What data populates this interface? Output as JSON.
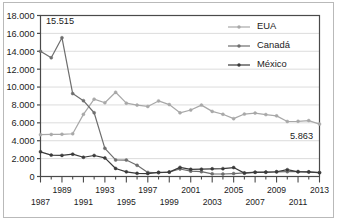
{
  "chart_data": {
    "type": "line",
    "title": "",
    "subtitle": "",
    "xlabel": "",
    "ylabel": "",
    "xlim": [
      1987,
      2013
    ],
    "ylim": [
      0,
      18000
    ],
    "grid": true,
    "grid_axis": "y",
    "legend_position": "top-right",
    "x": [
      1987,
      1988,
      1989,
      1990,
      1991,
      1992,
      1993,
      1994,
      1995,
      1996,
      1997,
      1998,
      1999,
      2000,
      2001,
      2002,
      2003,
      2004,
      2005,
      2006,
      2007,
      2008,
      2009,
      2010,
      2011,
      2012,
      2013
    ],
    "y_tick_labels": [
      "0",
      "2.000",
      "4.000",
      "6.000",
      "8.000",
      "10.000",
      "12.000",
      "14.000",
      "16.000",
      "18.000"
    ],
    "y_tick_values": [
      0,
      2000,
      4000,
      6000,
      8000,
      10000,
      12000,
      14000,
      16000,
      18000
    ],
    "x_tick_labels_upper": [
      "1989",
      "1993",
      "1997",
      "2001",
      "2005",
      "2009",
      "2013"
    ],
    "x_tick_values_upper": [
      1989,
      1993,
      1997,
      2001,
      2005,
      2009,
      2013
    ],
    "x_tick_labels_lower": [
      "1987",
      "1991",
      "1995",
      "1999",
      "2003",
      "2007",
      "2011"
    ],
    "x_tick_values_lower": [
      1987,
      1991,
      1995,
      1999,
      2003,
      2007,
      2011
    ],
    "series": [
      {
        "name": "EUA",
        "color": "#a8a8a8",
        "values": [
          4680,
          4700,
          4720,
          4780,
          6950,
          8650,
          8250,
          9420,
          8200,
          7980,
          7830,
          8450,
          8040,
          7120,
          7430,
          7980,
          7280,
          6960,
          6470,
          6980,
          7090,
          6920,
          6780,
          6150,
          6170,
          6250,
          5863
        ]
      },
      {
        "name": "Canadá",
        "color": "#6e6e6e",
        "values": [
          14000,
          13280,
          15515,
          9270,
          8480,
          7130,
          3150,
          1850,
          1840,
          1250,
          460,
          420,
          500,
          840,
          600,
          540,
          300,
          280,
          330,
          400,
          480,
          470,
          520,
          540,
          560,
          500,
          440
        ]
      },
      {
        "name": "México",
        "color": "#3a3a3a",
        "values": [
          2760,
          2390,
          2360,
          2500,
          2150,
          2350,
          2080,
          900,
          520,
          350,
          330,
          470,
          490,
          1020,
          800,
          820,
          860,
          880,
          1000,
          380,
          470,
          490,
          530,
          760,
          520,
          520,
          430
        ]
      }
    ],
    "annotations": [
      {
        "label": "15.515",
        "x": 1989,
        "y": 15515,
        "dx": -2,
        "dy": -14,
        "series": "Canadá"
      },
      {
        "label": "5.863",
        "x": 2013,
        "y": 5863,
        "dx": -18,
        "dy": 15,
        "series": "EUA"
      }
    ]
  },
  "legend": {
    "items": [
      {
        "label": "EUA",
        "color": "#a8a8a8"
      },
      {
        "label": "Canadá",
        "color": "#6e6e6e"
      },
      {
        "label": "México",
        "color": "#3a3a3a"
      }
    ]
  },
  "colors": {
    "axis": "#4a4a4a",
    "gridline": "#dcdcdc",
    "plot_background": "#ffffff",
    "figure_border": "#b9b9b9",
    "text": "#1b1b1b"
  }
}
